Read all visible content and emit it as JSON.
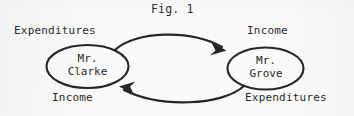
{
  "figure": {
    "title": "Fig. 1",
    "type": "circular-flow-diagram",
    "background_color": "#fafafa",
    "ink_color": "#2b2b2b"
  },
  "nodes": [
    {
      "id": "clarke",
      "line1": "Mr.",
      "line2": "Clarke",
      "text": "Mr.\nClarke",
      "shape": "ellipse"
    },
    {
      "id": "grove",
      "line1": "Mr.",
      "line2": "Grove",
      "text": "Mr.\nGrove",
      "shape": "ellipse"
    }
  ],
  "labels": {
    "top_left": "Expenditures",
    "top_right": "Income",
    "bottom_left": "Income",
    "bottom_right": "Expenditures"
  },
  "arrows": [
    {
      "id": "clarke-to-grove",
      "from": "clarke",
      "to": "grove",
      "direction": "left-to-right",
      "position": "top",
      "source_label": "Expenditures",
      "target_label": "Income"
    },
    {
      "id": "grove-to-clarke",
      "from": "grove",
      "to": "clarke",
      "direction": "right-to-left",
      "position": "bottom",
      "source_label": "Expenditures",
      "target_label": "Income"
    }
  ]
}
